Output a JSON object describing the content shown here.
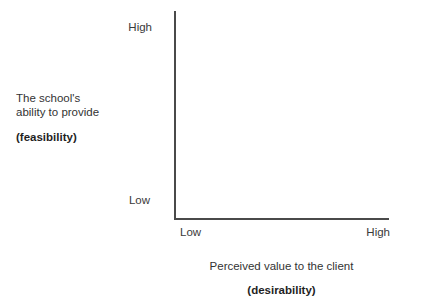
{
  "chart_data": {
    "type": "scatter",
    "title": "",
    "subtitle": "",
    "xlabel": "Perceived value to the client",
    "xlabel_emphasis": "(desirability)",
    "ylabel_line1": "The school's",
    "ylabel_line2": "ability to provide",
    "ylabel_emphasis": "(feasibility)",
    "x_tick_labels": [
      "Low",
      "High"
    ],
    "y_tick_labels": [
      "Low",
      "High"
    ],
    "xlim": [
      "Low",
      "High"
    ],
    "ylim": [
      "Low",
      "High"
    ],
    "grid": false,
    "legend": false,
    "series": [],
    "values": [],
    "annotations": [],
    "note": "Empty two-by-two prioritization matrix template; no data points plotted.",
    "axis_color": "#4a4a4a",
    "text_color": "#333333",
    "background_color": "#ffffff"
  },
  "axes": {
    "y": {
      "tick_high": "High",
      "tick_low": "Low",
      "title_line1": "The school's",
      "title_line2": "ability to provide",
      "title_emphasis": "(feasibility)"
    },
    "x": {
      "tick_low": "Low",
      "tick_high": "High",
      "title_line1": "Perceived value to the client",
      "title_emphasis": "(desirability)"
    }
  }
}
